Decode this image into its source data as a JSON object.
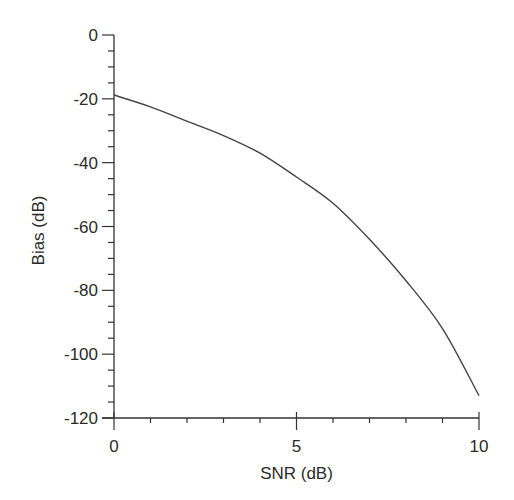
{
  "chart_data": {
    "type": "line",
    "title": "",
    "xlabel": "SNR (dB)",
    "ylabel": "Bias (dB)",
    "xlim": [
      0,
      10
    ],
    "ylim": [
      -120,
      0
    ],
    "grid": false,
    "legend": null,
    "x_ticks": [
      0,
      5,
      10
    ],
    "x_tick_labels": [
      "0",
      "5",
      "10"
    ],
    "x_minor_step": 1,
    "y_ticks": [
      0,
      -20,
      -40,
      -60,
      -80,
      -100,
      -120
    ],
    "y_tick_labels": [
      "0",
      "-20",
      "-40",
      "-60",
      "-80",
      "-100",
      "-120"
    ],
    "y_minor_step": 5,
    "series": [
      {
        "name": "Bias",
        "color": "#444444",
        "x": [
          0,
          1,
          2,
          3,
          4,
          5,
          6,
          7,
          8,
          9,
          10
        ],
        "values": [
          -18.8,
          -22.5,
          -27,
          -31.5,
          -37,
          -44.5,
          -52.7,
          -64,
          -77,
          -92,
          -113
        ]
      }
    ]
  },
  "layout": {
    "plot_left": 114,
    "plot_right": 479,
    "plot_top": 35,
    "plot_bottom": 418
  }
}
